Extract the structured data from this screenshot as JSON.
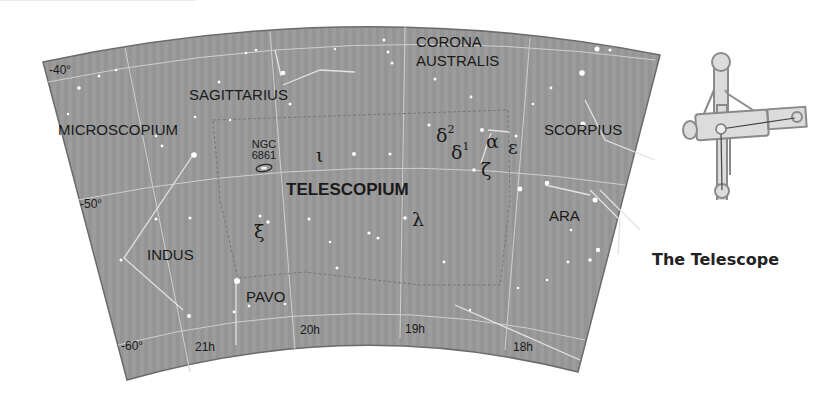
{
  "map": {
    "title": "TELESCOPIUM",
    "constellations": [
      {
        "name": "CORONA",
        "x": 416,
        "y": 35
      },
      {
        "name": "AUSTRALIS",
        "x": 416,
        "y": 53
      },
      {
        "name": "SAGITTARIUS",
        "x": 189,
        "y": 88
      },
      {
        "name": "MICROSCOPIUM",
        "x": 58,
        "y": 123
      },
      {
        "name": "SCORPIUS",
        "x": 544,
        "y": 123
      },
      {
        "name": "INDUS",
        "x": 147,
        "y": 248
      },
      {
        "name": "ARA",
        "x": 549,
        "y": 209
      },
      {
        "name": "PAVO",
        "x": 246,
        "y": 290
      }
    ],
    "objects": [
      {
        "line1": "NGC",
        "line2": "6861"
      }
    ],
    "stars": {
      "iota": "ι",
      "delta2": "δ",
      "delta2_sup": "2",
      "delta1": "δ",
      "delta1_sup": "1",
      "alpha": "α",
      "epsilon": "ε",
      "zeta": "ζ",
      "xi": "ξ",
      "lambda": "λ"
    },
    "declination_labels": [
      "-40°",
      "-50°",
      "-60°"
    ],
    "ra_labels": [
      "21h",
      "20h",
      "19h",
      "18h"
    ]
  },
  "figure": {
    "caption": "The Telescope"
  },
  "colors": {
    "sky": "#9a9a9a",
    "grid": "#d0d0d0",
    "text": "#1a1a1a"
  }
}
